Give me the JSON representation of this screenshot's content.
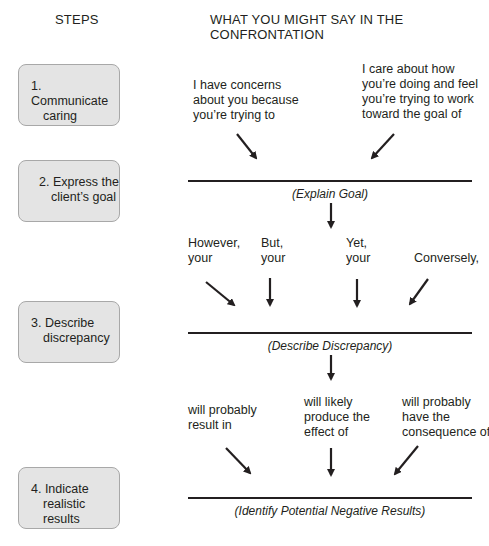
{
  "headers": {
    "steps": "STEPS",
    "what": "WHAT YOU MIGHT SAY IN THE CONFRONTATION"
  },
  "steps": [
    {
      "line1": "1. Communicate",
      "line2": "caring"
    },
    {
      "line1": "2. Express the",
      "line2": "client’s goal"
    },
    {
      "line1": "3. Describe",
      "line2": "discrepancy"
    },
    {
      "line1": "4. Indicate",
      "line2": "realistic results"
    }
  ],
  "phrases": {
    "caring_a": "I have concerns\nabout you because\nyou’re trying to",
    "caring_b": "I care about how\nyou’re doing and feel\nyou’re trying to work\ntoward the goal of",
    "however": "However,\nyour",
    "but": "But,\nyour",
    "yet": "Yet,\nyour",
    "conversely": "Conversely,",
    "result_in": "will probably\nresult in",
    "likely": "will likely\nproduce the\neffect of",
    "consequence": "will probably\nhave the\nconsequence of"
  },
  "labels": {
    "goal": "(Explain Goal)",
    "discrepancy": "(Describe Discrepancy)",
    "results": "(Identify Potential Negative Results)"
  }
}
